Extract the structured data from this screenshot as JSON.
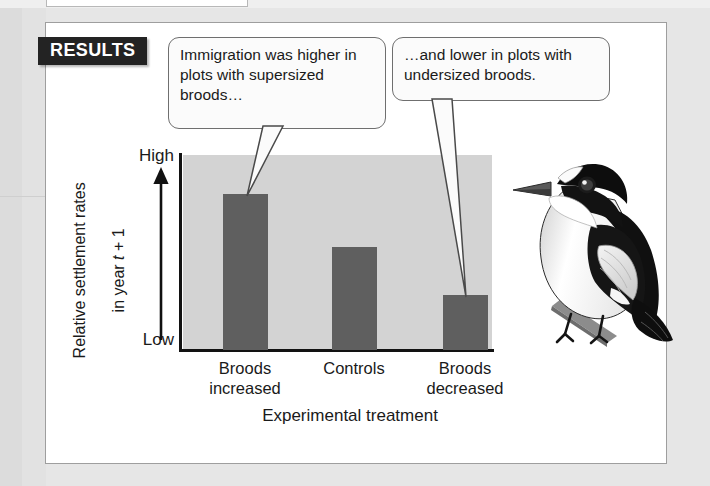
{
  "figure": {
    "section_badge": "RESULTS",
    "callouts": [
      {
        "id": "callout-left",
        "text": "Immigration was higher in plots with supersized broods…"
      },
      {
        "id": "callout-right",
        "text": "…and lower in plots with undersized broods."
      }
    ],
    "illustration": {
      "name": "collared-flycatcher-bird",
      "description": "Black and white perching bird facing left on a branch"
    }
  },
  "chart_data": {
    "type": "bar",
    "title": "",
    "categories": [
      "Broods\nincreased",
      "Controls",
      "Broods\ndecreased"
    ],
    "category_labels_flat": [
      "Broods increased",
      "Controls",
      "Broods decreased"
    ],
    "values": [
      80,
      53,
      28
    ],
    "xlabel": "Experimental treatment",
    "ylabel": "Relative settlement rates\nin year t + 1",
    "ylabel_line1": "Relative settlement rates",
    "ylabel_line2_prefix": "in year ",
    "ylabel_line2_italic": "t",
    "ylabel_line2_suffix": " + 1",
    "ytick_labels": [
      "High",
      "Low"
    ],
    "ylim": [
      0,
      100
    ],
    "grid": false,
    "legend": false,
    "bar_color": "#5f5f5f",
    "plot_background": "#d3d3d3",
    "axis_color": "#121212"
  },
  "colors": {
    "page_background": "#e6e6e6",
    "card_background": "#ffffff",
    "badge_background": "#232323",
    "badge_text": "#ffffff",
    "callout_border": "#6f6f6f",
    "callout_fill": "#fbfbfb",
    "text": "#1a1a1a"
  }
}
